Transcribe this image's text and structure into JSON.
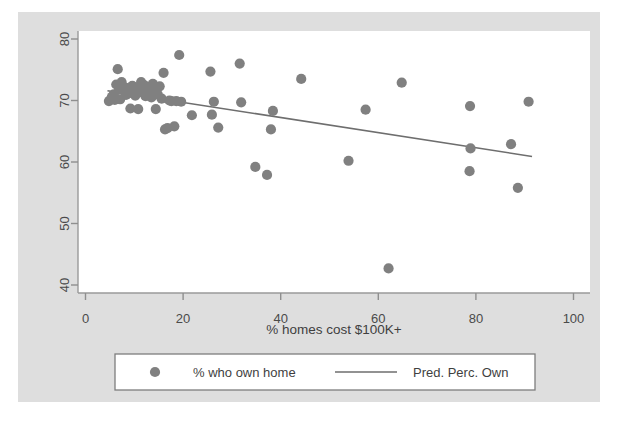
{
  "chart_data": {
    "type": "scatter",
    "title": "",
    "subtitle": "",
    "xlabel": "% homes cost $100K+",
    "ylabel": "",
    "xlim": [
      0,
      100
    ],
    "ylim": [
      40,
      80
    ],
    "xticks": [
      0,
      20,
      40,
      60,
      80,
      100
    ],
    "yticks": [
      40,
      50,
      60,
      70,
      80
    ],
    "xtick_labels": [
      "0",
      "20",
      "40",
      "60",
      "80",
      "100"
    ],
    "ytick_labels": [
      "40",
      "50",
      "60",
      "70",
      "80"
    ],
    "grid": false,
    "legend_position": "bottom",
    "marker_color": "#808080",
    "line_color": "#6e6e6e",
    "panel_color": "#dedede",
    "plot_bg_color": "#ffffff",
    "series": [
      {
        "name": "% who own home",
        "kind": "scatter",
        "marker": "circle",
        "color": "#808080",
        "points": [
          [
            4.8,
            69.9
          ],
          [
            5.4,
            70.6
          ],
          [
            5.8,
            71.0
          ],
          [
            6.0,
            70.1
          ],
          [
            6.3,
            72.6
          ],
          [
            6.6,
            75.1
          ],
          [
            6.9,
            71.8
          ],
          [
            7.1,
            70.2
          ],
          [
            7.4,
            73.0
          ],
          [
            7.7,
            72.3
          ],
          [
            8.0,
            71.5
          ],
          [
            8.3,
            70.9
          ],
          [
            8.6,
            72.0
          ],
          [
            8.9,
            71.2
          ],
          [
            9.2,
            68.7
          ],
          [
            9.6,
            72.4
          ],
          [
            9.9,
            71.6
          ],
          [
            10.2,
            70.8
          ],
          [
            10.5,
            72.1
          ],
          [
            10.8,
            68.6
          ],
          [
            11.1,
            71.9
          ],
          [
            11.4,
            73.0
          ],
          [
            11.7,
            71.3
          ],
          [
            12.0,
            72.5
          ],
          [
            12.3,
            70.7
          ],
          [
            12.6,
            71.1
          ],
          [
            12.9,
            72.2
          ],
          [
            13.2,
            71.7
          ],
          [
            13.5,
            70.5
          ],
          [
            13.8,
            72.7
          ],
          [
            14.1,
            71.4
          ],
          [
            14.4,
            68.6
          ],
          [
            14.8,
            71.0
          ],
          [
            15.2,
            72.3
          ],
          [
            15.6,
            70.3
          ],
          [
            16.0,
            74.5
          ],
          [
            16.3,
            65.3
          ],
          [
            16.8,
            65.5
          ],
          [
            17.2,
            70.0
          ],
          [
            17.6,
            69.9
          ],
          [
            18.2,
            65.8
          ],
          [
            18.6,
            69.9
          ],
          [
            19.2,
            77.4
          ],
          [
            19.6,
            69.8
          ],
          [
            21.8,
            67.6
          ],
          [
            25.6,
            74.7
          ],
          [
            25.9,
            67.7
          ],
          [
            26.3,
            69.8
          ],
          [
            27.2,
            65.6
          ],
          [
            31.6,
            76.0
          ],
          [
            31.9,
            69.7
          ],
          [
            34.8,
            59.2
          ],
          [
            37.2,
            57.9
          ],
          [
            38.4,
            68.3
          ],
          [
            38.0,
            65.3
          ],
          [
            44.2,
            73.5
          ],
          [
            53.9,
            60.2
          ],
          [
            57.4,
            68.5
          ],
          [
            62.1,
            42.7
          ],
          [
            64.8,
            72.9
          ],
          [
            78.8,
            69.1
          ],
          [
            78.9,
            62.2
          ],
          [
            78.7,
            58.5
          ],
          [
            87.2,
            62.9
          ],
          [
            88.6,
            55.8
          ],
          [
            90.8,
            69.8
          ]
        ]
      },
      {
        "name": "Pred. Perc. Own",
        "kind": "line",
        "color": "#6e6e6e",
        "points": [
          [
            4.5,
            71.6
          ],
          [
            91.5,
            60.9
          ]
        ]
      }
    ]
  },
  "legend": {
    "items": [
      {
        "label": "% who own home",
        "marker": "circle-marker"
      },
      {
        "label": "Pred. Perc. Own",
        "marker": "line-marker"
      }
    ]
  }
}
